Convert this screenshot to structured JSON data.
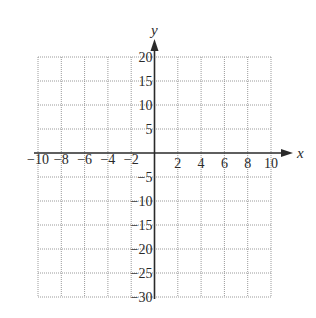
{
  "chart_data": {
    "type": "scatter",
    "title": "",
    "xlabel": "x",
    "ylabel": "y",
    "xlim": [
      -10,
      10
    ],
    "ylim": [
      -30,
      20
    ],
    "grid": true,
    "grid_style": "dotted",
    "x_grid_step": 2,
    "y_grid_step": 5,
    "x_ticks": [
      -10,
      -8,
      -6,
      -4,
      -2,
      2,
      4,
      6,
      8,
      10
    ],
    "x_tick_labels": [
      "−10",
      "−8",
      "−6",
      "−4",
      "−2",
      "2",
      "4",
      "6",
      "8",
      "10"
    ],
    "y_ticks": [
      20,
      15,
      10,
      5,
      -5,
      -10,
      -15,
      -20,
      -25,
      -30
    ],
    "y_tick_labels": [
      "20",
      "15",
      "10",
      "5",
      "−5",
      "−10",
      "−15",
      "−20",
      "−25",
      "−30"
    ],
    "series": [],
    "legend": null
  },
  "colors": {
    "axis": "#2a2a2a",
    "grid": "#9a9a9a",
    "background": "#ffffff"
  }
}
